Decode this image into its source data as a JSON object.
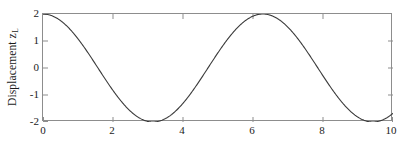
{
  "figure": {
    "background_color": "#ffffff",
    "axes_color": "#8d8d8d",
    "line_color": "#3a3a3a",
    "text_color": "#1a1a1a"
  },
  "ylabel": {
    "text": "Displacement z",
    "subscript": "L"
  },
  "chart_data": {
    "type": "line",
    "title": "",
    "xlabel": "",
    "ylabel": "Displacement z_L",
    "xlim": [
      0,
      10
    ],
    "ylim": [
      -2,
      2
    ],
    "xticks": [
      "0",
      "2",
      "4",
      "6",
      "8",
      "10"
    ],
    "xtick_values": [
      0,
      2,
      4,
      6,
      8,
      10
    ],
    "yticks": [
      "2",
      "1",
      "0",
      "-1",
      "-2"
    ],
    "ytick_values": [
      2,
      1,
      0,
      -1,
      -2
    ],
    "grid": false,
    "legend": false,
    "series": [
      {
        "name": "z_L",
        "expression": "2*cos(x)",
        "x": [
          0.0,
          0.2,
          0.4,
          0.6,
          0.8,
          1.0,
          1.2,
          1.4,
          1.6,
          1.8,
          2.0,
          2.2,
          2.4,
          2.6,
          2.8,
          3.0,
          3.2,
          3.4,
          3.6,
          3.8,
          4.0,
          4.2,
          4.4,
          4.6,
          4.8,
          5.0,
          5.2,
          5.4,
          5.6,
          5.8,
          6.0,
          6.2,
          6.4,
          6.6,
          6.8,
          7.0,
          7.2,
          7.4,
          7.6,
          7.8,
          8.0,
          8.2,
          8.4,
          8.6,
          8.8,
          9.0,
          9.2,
          9.4,
          9.6,
          9.8,
          10.0
        ],
        "y": [
          2.0,
          1.96,
          1.84,
          1.65,
          1.39,
          1.08,
          0.72,
          0.34,
          -0.06,
          -0.45,
          -0.83,
          -1.18,
          -1.48,
          -1.72,
          -1.89,
          -1.98,
          -2.0,
          -1.94,
          -1.8,
          -1.58,
          -1.31,
          -0.98,
          -0.61,
          -0.22,
          0.17,
          0.57,
          0.94,
          1.27,
          1.55,
          1.77,
          1.92,
          1.99,
          1.99,
          1.9,
          1.74,
          1.51,
          1.21,
          0.87,
          0.49,
          0.1,
          -0.29,
          -0.67,
          -1.02,
          -1.34,
          -1.6,
          -1.82,
          -1.95,
          -2.0,
          -1.96,
          -1.83,
          -1.68
        ]
      }
    ]
  }
}
